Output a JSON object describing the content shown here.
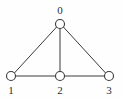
{
  "figure": {
    "kind": "undirected-graph-diagram",
    "background_color": "#fefefe",
    "width": 122,
    "height": 100,
    "edge_color": "#3a3a3a",
    "node_fill_color": "#ffffff",
    "node_stroke_color": "#3a3a3a",
    "label_color": "#2e2e2e"
  },
  "graph": {
    "nodes": [
      {
        "id": "0",
        "label": "0",
        "cx": 60,
        "cy": 24,
        "r": 4.5,
        "label_x": 53,
        "label_y": 5
      },
      {
        "id": "1",
        "label": "1",
        "cx": 11,
        "cy": 76,
        "r": 4.5,
        "label_x": 4,
        "label_y": 85
      },
      {
        "id": "2",
        "label": "2",
        "cx": 60,
        "cy": 76,
        "r": 4.5,
        "label_x": 53,
        "label_y": 85
      },
      {
        "id": "3",
        "label": "3",
        "cx": 109,
        "cy": 76,
        "r": 4.5,
        "label_x": 102,
        "label_y": 85
      }
    ],
    "edges": [
      {
        "from": "0",
        "to": "1",
        "x1": 56.6,
        "y1": 27.0,
        "x2": 14.4,
        "y2": 73.0
      },
      {
        "from": "0",
        "to": "2",
        "x1": 60.0,
        "y1": 28.5,
        "x2": 60.0,
        "y2": 71.5
      },
      {
        "from": "0",
        "to": "3",
        "x1": 63.4,
        "y1": 27.0,
        "x2": 105.6,
        "y2": 73.0
      },
      {
        "from": "1",
        "to": "2",
        "x1": 15.5,
        "y1": 76.0,
        "x2": 55.5,
        "y2": 76.0
      },
      {
        "from": "2",
        "to": "3",
        "x1": 64.5,
        "y1": 76.0,
        "x2": 104.5,
        "y2": 76.0
      }
    ]
  }
}
